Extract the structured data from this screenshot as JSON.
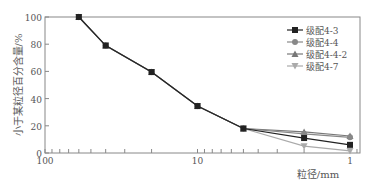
{
  "chart_data": {
    "type": "line",
    "title": "",
    "xlabel": "粒径/mm",
    "ylabel": "小于某粒径百分含量/%",
    "xscale": "log",
    "x_reversed": true,
    "xlim": [
      100,
      0.85
    ],
    "ylim": [
      0,
      100
    ],
    "x_ticks": [
      100,
      10,
      1
    ],
    "x_tick_labels": [
      "100",
      "10",
      "1"
    ],
    "y_ticks": [
      0,
      20,
      40,
      60,
      80,
      100
    ],
    "y_tick_labels": [
      "0",
      "20",
      "40",
      "60",
      "80",
      "100"
    ],
    "legend_position": "top-right",
    "x": [
      60,
      40,
      20,
      10,
      5,
      2,
      1
    ],
    "series": [
      {
        "name": "级配4-3",
        "marker": "square",
        "color": "#222222",
        "values": [
          100,
          79,
          59.5,
          34.5,
          18,
          11,
          6
        ]
      },
      {
        "name": "级配4-4",
        "marker": "circle",
        "color": "#888888",
        "values": [
          100,
          79,
          59.5,
          34.5,
          18,
          14,
          11.5
        ]
      },
      {
        "name": "级配4-4-2",
        "marker": "triangle-up",
        "color": "#777777",
        "values": [
          100,
          79,
          59.5,
          34.5,
          18,
          15.5,
          12.5
        ]
      },
      {
        "name": "级配4-7",
        "marker": "triangle-down",
        "color": "#aaaaaa",
        "values": [
          100,
          79,
          59.5,
          34.5,
          18,
          5,
          1.5
        ]
      }
    ]
  }
}
